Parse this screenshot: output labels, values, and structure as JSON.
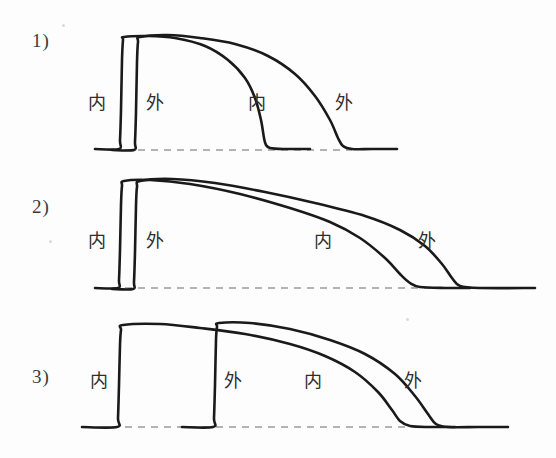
{
  "figure": {
    "title_visible": false,
    "background_color": "#fdfdfd",
    "line_color": "#1a1a1a",
    "baseline_color": "#9a9a9a",
    "width": 556,
    "height": 458
  },
  "panels": [
    {
      "number_label": "1)",
      "number_x": 32,
      "number_y": 30,
      "baseline_y": 150,
      "labels": [
        {
          "text": "内",
          "x": 88,
          "y": 94
        },
        {
          "text": "外",
          "x": 146,
          "y": 94
        },
        {
          "text": "内",
          "x": 248,
          "y": 94
        },
        {
          "text": "外",
          "x": 335,
          "y": 94
        }
      ],
      "dashed_baseline": {
        "x1": 112,
        "x2": 352,
        "y": 150
      },
      "traces": [
        {
          "name": "inner-trace",
          "points": "95,149 119,149 120,140 121,110 122,60 123,40 124,37 148,36 175,38 205,46 228,60 245,78 255,98 261,120 264,138 266,145 270,148 283,149 310,149"
        },
        {
          "name": "outer-trace",
          "points": "112,150 134,150 135,142 136,112 137,62 138,42 140,37 168,35 200,38 235,44 268,56 295,74 315,96 330,120 338,138 343,146 352,149 372,149 397,149"
        }
      ]
    },
    {
      "number_label": "2)",
      "number_x": 32,
      "number_y": 196,
      "baseline_y": 288,
      "labels": [
        {
          "text": "内",
          "x": 88,
          "y": 232
        },
        {
          "text": "外",
          "x": 146,
          "y": 232
        },
        {
          "text": "内",
          "x": 314,
          "y": 232
        },
        {
          "text": "外",
          "x": 418,
          "y": 232
        }
      ],
      "dashed_baseline": {
        "x1": 112,
        "x2": 470,
        "y": 288
      },
      "traces": [
        {
          "name": "inner-trace",
          "points": "95,288 118,288 119,280 120,250 121,205 122,186 124,181 150,180 190,184 240,194 290,208 330,222 360,238 385,258 400,274 410,283 420,287 445,288 470,288"
        },
        {
          "name": "outer-trace",
          "points": "112,289 133,289 134,282 135,252 136,206 137,187 140,181 172,179 215,183 265,192 315,203 365,216 400,230 425,246 442,264 452,278 460,286 480,288 535,288"
        }
      ]
    },
    {
      "number_label": "3)",
      "number_x": 32,
      "number_y": 366,
      "baseline_y": 427,
      "labels": [
        {
          "text": "内",
          "x": 90,
          "y": 372
        },
        {
          "text": "外",
          "x": 224,
          "y": 372
        },
        {
          "text": "内",
          "x": 304,
          "y": 372
        },
        {
          "text": "外",
          "x": 404,
          "y": 372
        }
      ],
      "dashed_baseline": {
        "x1": 112,
        "x2": 465,
        "y": 427
      },
      "traces": [
        {
          "name": "inner-trace",
          "points": "82,427 117,427 118,418 119,385 120,345 121,330 123,325 160,324 200,328 245,334 290,344 325,356 355,372 378,392 392,410 400,421 410,426 430,427 455,427"
        },
        {
          "name": "outer-trace",
          "points": "182,427 213,427 214,418 215,385 216,340 217,327 219,323 250,323 290,329 330,340 365,354 395,374 415,396 428,414 436,424 448,427 478,427 508,427"
        }
      ]
    }
  ],
  "legend_meaning": {
    "inner": "内",
    "outer": "外"
  }
}
